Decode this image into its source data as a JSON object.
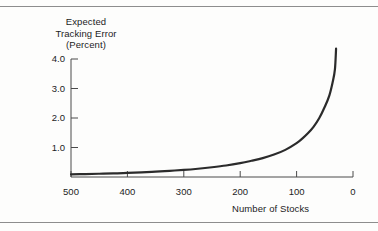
{
  "chart_data": {
    "type": "line",
    "title": "",
    "ylabel": "Expected Tracking Error (Percent)",
    "ylabel_lines": [
      "Expected",
      "Tracking Error",
      "(Percent)"
    ],
    "xlabel": "Number of Stocks",
    "xlim": [
      500,
      0
    ],
    "ylim": [
      0,
      4.6
    ],
    "x_ticks": [
      500,
      400,
      300,
      200,
      100,
      0
    ],
    "x_tick_labels": [
      "500",
      "400",
      "300",
      "200",
      "100",
      "0"
    ],
    "y_ticks": [
      1.0,
      2.0,
      3.0,
      4.0
    ],
    "y_tick_labels": [
      "1.0",
      "2.0",
      "3.0",
      "4.0"
    ],
    "grid": false,
    "legend": false,
    "x_axis_reversed": true,
    "line_color": "#2b2b2b",
    "line_width": 2.2,
    "series": [
      {
        "name": "Expected Tracking Error",
        "x": [
          500,
          475,
          450,
          425,
          400,
          375,
          350,
          325,
          300,
          275,
          250,
          225,
          200,
          180,
          160,
          140,
          120,
          100,
          90,
          80,
          70,
          60,
          50,
          42,
          36,
          32,
          30
        ],
        "values": [
          0.09,
          0.1,
          0.11,
          0.12,
          0.14,
          0.16,
          0.18,
          0.21,
          0.24,
          0.28,
          0.33,
          0.39,
          0.47,
          0.55,
          0.64,
          0.76,
          0.92,
          1.15,
          1.3,
          1.48,
          1.7,
          1.99,
          2.38,
          2.76,
          3.22,
          3.66,
          4.35
        ]
      }
    ]
  },
  "axis": {
    "y_title_line1": "Expected",
    "y_title_line2": "Tracking Error",
    "y_title_line3": "(Percent)",
    "x_title": "Number of Stocks"
  },
  "colors": {
    "curve": "#2b2b2b",
    "axis": "#4a4a4a",
    "rule": "#8d8d8d",
    "text": "#1c1c1c",
    "background": "#fdfdfc"
  }
}
